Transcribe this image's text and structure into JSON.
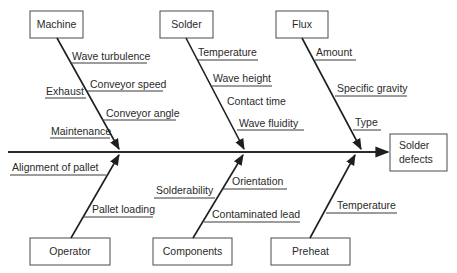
{
  "effect": {
    "label_line1": "Solder",
    "label_line2": "defects"
  },
  "categories": {
    "machine": {
      "label": "Machine",
      "causes": [
        "Wave turbulence",
        "Conveyor speed",
        "Exhaust",
        "Conveyor angle",
        "Maintenance"
      ]
    },
    "solder": {
      "label": "Solder",
      "causes": [
        "Temperature",
        "Wave height",
        "Contact time",
        "Wave fluidity"
      ]
    },
    "flux": {
      "label": "Flux",
      "causes": [
        "Amount",
        "Specific gravity",
        "Type"
      ]
    },
    "operator": {
      "label": "Operator",
      "causes": [
        "Alignment of pallet",
        "Pallet loading"
      ]
    },
    "components": {
      "label": "Components",
      "causes": [
        "Solderability",
        "Orientation",
        "Contaminated lead"
      ]
    },
    "preheat": {
      "label": "Preheat",
      "causes": [
        "Temperature"
      ]
    }
  },
  "colors": {
    "line": "#1e1e1e",
    "text": "#2a2a2a",
    "background": "#ffffff"
  }
}
